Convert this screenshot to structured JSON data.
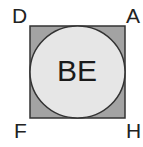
{
  "diagram": {
    "type": "square-with-inscribed-circle",
    "vertices": {
      "top_left": "D",
      "top_right": "A",
      "bottom_left": "F",
      "bottom_right": "H"
    },
    "circle_label": "BE",
    "colors": {
      "square_fill": "#a3a3a3",
      "circle_fill": "#e6e6e6",
      "stroke": "#333333",
      "text": "#222222"
    }
  }
}
